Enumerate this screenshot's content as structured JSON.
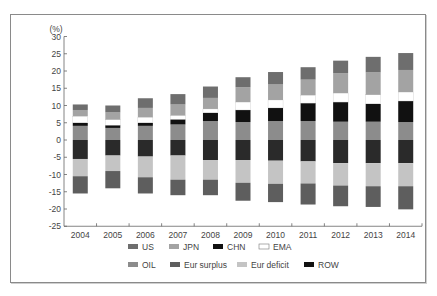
{
  "chart_data": {
    "type": "bar",
    "stacked": true,
    "title": "",
    "ylabel": "(%)",
    "xlabel": "",
    "ylim": [
      -25,
      30
    ],
    "yticks": [
      30,
      25,
      20,
      15,
      10,
      5,
      0,
      -5,
      -10,
      -15,
      -20,
      -25
    ],
    "grid": false,
    "legend_position": "bottom",
    "categories": [
      "2004",
      "2005",
      "2006",
      "2007",
      "2008",
      "2009",
      "2010",
      "2011",
      "2012",
      "2013",
      "2014"
    ],
    "series": [
      {
        "name": "OIL",
        "color": "#8c8c8c",
        "values": [
          4.1,
          3.5,
          4.1,
          4.5,
          5.5,
          5.2,
          5.5,
          5.5,
          5.3,
          5.3,
          5.2
        ]
      },
      {
        "name": "CHN",
        "color": "#111111",
        "values": [
          0.9,
          0.8,
          0.9,
          1.5,
          2.4,
          3.5,
          3.8,
          5.2,
          5.7,
          5.2,
          6.1
        ]
      },
      {
        "name": "EMA",
        "color": "#ffffff",
        "values": [
          1.9,
          1.6,
          1.6,
          1.1,
          1.1,
          2.3,
          2.3,
          2.3,
          2.6,
          2.6,
          2.6
        ]
      },
      {
        "name": "JPN",
        "color": "#a3a3a3",
        "values": [
          1.8,
          2.1,
          2.7,
          3.2,
          3.2,
          4.3,
          4.5,
          4.5,
          5.8,
          6.5,
          6.4
        ]
      },
      {
        "name": "US",
        "color": "#6e6e6e",
        "values": [
          1.6,
          2.0,
          2.8,
          3.0,
          3.3,
          2.9,
          3.6,
          3.6,
          3.6,
          4.5,
          4.9
        ]
      },
      {
        "name": "ROW",
        "color": "#2a2a2a",
        "values": [
          -5.5,
          -4.5,
          -4.8,
          -4.5,
          -5.8,
          -5.8,
          -6.0,
          -6.2,
          -6.7,
          -6.7,
          -6.7
        ]
      },
      {
        "name": "Eur deficit",
        "color": "#c4c4c4",
        "values": [
          -5.0,
          -4.5,
          -6.0,
          -7.0,
          -5.7,
          -6.6,
          -6.7,
          -6.4,
          -6.5,
          -6.7,
          -6.7
        ]
      },
      {
        "name": "Eur surplus",
        "color": "#5e5e5e",
        "values": [
          -5.0,
          -5.0,
          -4.7,
          -4.5,
          -4.5,
          -5.2,
          -5.3,
          -6.1,
          -6.0,
          -6.0,
          -6.7
        ]
      }
    ],
    "legend": [
      {
        "name": "US",
        "color": "#6e6e6e"
      },
      {
        "name": "JPN",
        "color": "#a3a3a3"
      },
      {
        "name": "CHN",
        "color": "#111111"
      },
      {
        "name": "EMA",
        "color": "#ffffff"
      },
      {
        "name": "OIL",
        "color": "#8c8c8c"
      },
      {
        "name": "Eur surplus",
        "color": "#5e5e5e"
      },
      {
        "name": "Eur deficit",
        "color": "#c4c4c4"
      },
      {
        "name": "ROW",
        "color": "#111111"
      }
    ]
  }
}
